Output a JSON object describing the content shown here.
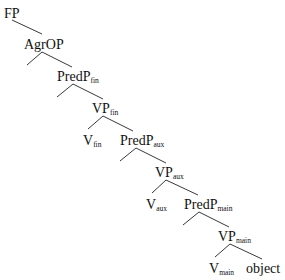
{
  "diagram": {
    "type": "syntax-tree",
    "nodes": [
      {
        "id": "fp",
        "label": "FP",
        "sub": ""
      },
      {
        "id": "agrop",
        "label": "AgrOP",
        "sub": ""
      },
      {
        "id": "predp-fin",
        "label": "PredP",
        "sub": "fin"
      },
      {
        "id": "vp-fin",
        "label": "VP",
        "sub": "fin"
      },
      {
        "id": "v-fin",
        "label": "V",
        "sub": "fin"
      },
      {
        "id": "predp-aux",
        "label": "PredP",
        "sub": "aux"
      },
      {
        "id": "vp-aux",
        "label": "VP",
        "sub": "aux"
      },
      {
        "id": "v-aux",
        "label": "V",
        "sub": "aux"
      },
      {
        "id": "predp-main",
        "label": "PredP",
        "sub": "main"
      },
      {
        "id": "vp-main",
        "label": "VP",
        "sub": "main"
      },
      {
        "id": "v-main",
        "label": "V",
        "sub": "main"
      },
      {
        "id": "object",
        "label": "object",
        "sub": ""
      }
    ],
    "edges": [
      [
        "fp",
        "agrop"
      ],
      [
        "agrop",
        "empty-1"
      ],
      [
        "agrop",
        "predp-fin"
      ],
      [
        "predp-fin",
        "empty-2"
      ],
      [
        "predp-fin",
        "vp-fin"
      ],
      [
        "vp-fin",
        "v-fin"
      ],
      [
        "vp-fin",
        "predp-aux"
      ],
      [
        "predp-aux",
        "empty-3"
      ],
      [
        "predp-aux",
        "vp-aux"
      ],
      [
        "vp-aux",
        "v-aux"
      ],
      [
        "vp-aux",
        "predp-main"
      ],
      [
        "predp-main",
        "empty-4"
      ],
      [
        "predp-main",
        "vp-main"
      ],
      [
        "vp-main",
        "v-main"
      ],
      [
        "vp-main",
        "object"
      ]
    ]
  }
}
